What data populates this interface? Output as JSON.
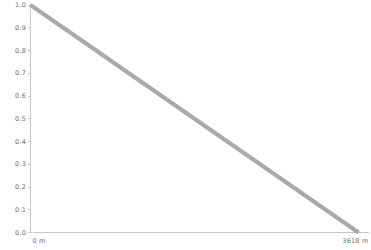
{
  "chart_data": {
    "type": "line",
    "title": "",
    "subtitle": "",
    "xlabel": "",
    "ylabel": "",
    "xlim": [
      0,
      3618
    ],
    "ylim": [
      0.0,
      1.0
    ],
    "grid": false,
    "legend": null,
    "x_unit": "m",
    "series": [
      {
        "name": "decay",
        "color": "#9a9a9a",
        "line_width": 4,
        "x": [
          0,
          3618
        ],
        "values": [
          1.0,
          0.0
        ],
        "points": [
          {
            "x": 0,
            "y": 1.0
          },
          {
            "x": 362,
            "y": 0.9
          },
          {
            "x": 724,
            "y": 0.8
          },
          {
            "x": 1085,
            "y": 0.7
          },
          {
            "x": 1447,
            "y": 0.6
          },
          {
            "x": 1809,
            "y": 0.5
          },
          {
            "x": 2171,
            "y": 0.4
          },
          {
            "x": 2533,
            "y": 0.3
          },
          {
            "x": 2894,
            "y": 0.2
          },
          {
            "x": 3256,
            "y": 0.1
          },
          {
            "x": 3618,
            "y": 0.0
          }
        ]
      }
    ],
    "y_ticks": [
      {
        "value": 1.0,
        "label": "1.0"
      },
      {
        "value": 0.9,
        "label": "0.9"
      },
      {
        "value": 0.8,
        "label": "0.8"
      },
      {
        "value": 0.7,
        "label": "0.7"
      },
      {
        "value": 0.6,
        "label": "0.6"
      },
      {
        "value": 0.5,
        "label": "0.5"
      },
      {
        "value": 0.4,
        "label": "0.4"
      },
      {
        "value": 0.3,
        "label": "0.3"
      },
      {
        "value": 0.2,
        "label": "0.2"
      },
      {
        "value": 0.1,
        "label": "0.1"
      },
      {
        "value": 0.0,
        "label": "0.0"
      }
    ],
    "x_ticks": [
      {
        "value": 0,
        "label": "0 m"
      },
      {
        "value": 3618,
        "label": "3618 m"
      }
    ]
  },
  "style": {
    "background": "#ffffff",
    "axis_color": "#c8c8c8",
    "tick_color": "#c8c8c8",
    "label_color": "#6e6e6e",
    "series_color": "#9a9a9a"
  }
}
